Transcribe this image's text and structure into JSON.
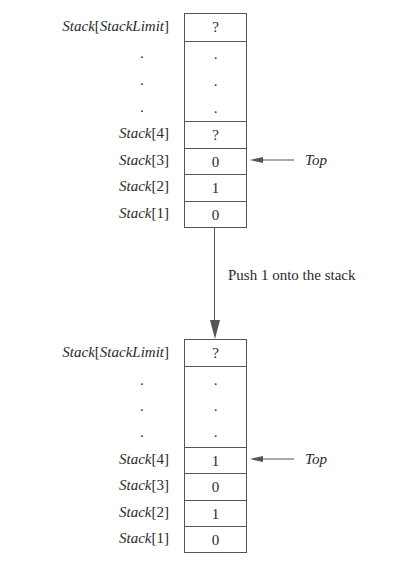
{
  "diagram": {
    "type": "stack push operation",
    "before": {
      "label_top": {
        "name": "Stack",
        "index": "StackLimit",
        "value": "?"
      },
      "ellipsis": [
        ".",
        ".",
        "."
      ],
      "rows": [
        {
          "name": "Stack",
          "index": "4",
          "value": "?"
        },
        {
          "name": "Stack",
          "index": "3",
          "value": "0"
        },
        {
          "name": "Stack",
          "index": "2",
          "value": "1"
        },
        {
          "name": "Stack",
          "index": "1",
          "value": "0"
        }
      ],
      "top_pointer": {
        "label": "Top",
        "points_to": "Stack[3]"
      }
    },
    "transition": {
      "label": "Push 1 onto the stack"
    },
    "after": {
      "label_top": {
        "name": "Stack",
        "index": "StackLimit",
        "value": "?"
      },
      "ellipsis": [
        ".",
        ".",
        "."
      ],
      "rows": [
        {
          "name": "Stack",
          "index": "4",
          "value": "1"
        },
        {
          "name": "Stack",
          "index": "3",
          "value": "0"
        },
        {
          "name": "Stack",
          "index": "2",
          "value": "1"
        },
        {
          "name": "Stack",
          "index": "1",
          "value": "0"
        }
      ],
      "top_pointer": {
        "label": "Top",
        "points_to": "Stack[4]"
      }
    },
    "colors": {
      "line": "#555555",
      "text": "#2a2a2a",
      "background": "#ffffff"
    }
  }
}
